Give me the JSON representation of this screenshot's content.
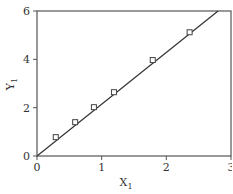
{
  "chart_data": {
    "type": "scatter",
    "title": "",
    "xlabel": "X",
    "xlabel_subscript": "1",
    "ylabel": "Y",
    "ylabel_subscript": "1",
    "xlim": [
      0,
      3
    ],
    "ylim": [
      0,
      6
    ],
    "xticks": [
      "0",
      "1",
      "2",
      "3"
    ],
    "yticks": [
      "0",
      "2",
      "4",
      "6"
    ],
    "grid": false,
    "legend": null,
    "series": [
      {
        "name": "data",
        "marker": "square-open",
        "x": [
          0.29,
          0.59,
          0.88,
          1.19,
          1.79,
          2.36
        ],
        "y": [
          0.78,
          1.4,
          2.02,
          2.64,
          3.97,
          5.12
        ]
      },
      {
        "name": "fit",
        "type": "line",
        "x": [
          0,
          2.8
        ],
        "y": [
          0,
          6
        ]
      }
    ]
  },
  "colors": {
    "frame": "#555555",
    "line": "#333333",
    "marker": "#444444",
    "text": "#333333"
  }
}
